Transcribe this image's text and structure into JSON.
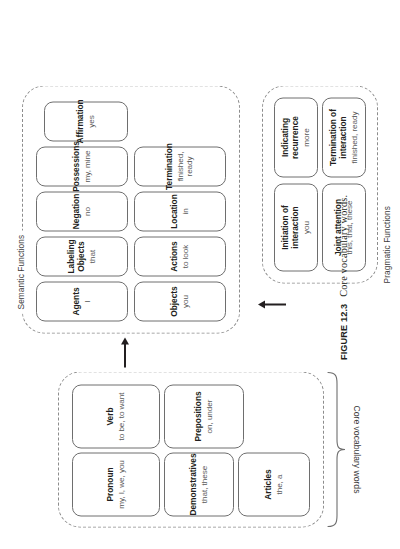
{
  "figure": {
    "number": "FIGURE 12.3",
    "caption": "Core vocabulary words."
  },
  "brace": {
    "label": "Core vocabulary words"
  },
  "groups": {
    "core": {
      "label": "",
      "boxes": [
        {
          "title": "Pronoun",
          "subtitle": "my, I, we, you"
        },
        {
          "title": "Demonstratives",
          "subtitle": "that, these"
        },
        {
          "title": "Articles",
          "subtitle": "the, a"
        },
        {
          "title": "Verb",
          "subtitle": "to be, to want"
        },
        {
          "title": "Prepositions",
          "subtitle": "on, under"
        }
      ]
    },
    "semantic": {
      "label": "Semantic Functions",
      "boxes": [
        {
          "title": "Agents",
          "subtitle": "I"
        },
        {
          "title": "Labeling Objects",
          "subtitle": "that"
        },
        {
          "title": "Negation",
          "subtitle": "no"
        },
        {
          "title": "Possessions",
          "subtitle": "my, mine"
        },
        {
          "title": "Affirmation",
          "subtitle": "yes"
        },
        {
          "title": "Objects",
          "subtitle": "you"
        },
        {
          "title": "Actions",
          "subtitle": "to look"
        },
        {
          "title": "Location",
          "subtitle": "in"
        },
        {
          "title": "Termination",
          "subtitle": "finished, ready"
        }
      ]
    },
    "pragmatic": {
      "label": "Pragmatic Functions",
      "boxes": [
        {
          "title": "Initiation of interaction",
          "subtitle": "you"
        },
        {
          "title": "Joint attention",
          "subtitle": "this, that, these"
        },
        {
          "title": "Indicating recurrence",
          "subtitle": "more"
        },
        {
          "title": "Termination of interaction",
          "subtitle": "finished, ready"
        }
      ]
    }
  },
  "arrows": {
    "to_semantic": "arrow-up",
    "to_pragmatic": "arrow-right"
  },
  "colors": {
    "box_border": "#6e6e6e",
    "group_border": "#8c8c8c",
    "text": "#231f20",
    "subtitle": "#5a5a5a"
  }
}
